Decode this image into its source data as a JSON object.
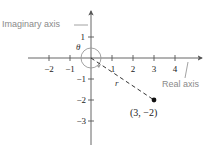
{
  "diagram": {
    "type": "complex-plane",
    "labels": {
      "imaginary_axis": "Imaginary axis",
      "real_axis": "Real axis",
      "theta": "θ",
      "r": "r",
      "point": "(3, −2)"
    },
    "x_ticks": [
      {
        "value": -2,
        "label": "−2"
      },
      {
        "value": -1,
        "label": "−1"
      },
      {
        "value": 1,
        "label": "1"
      },
      {
        "value": 2,
        "label": "2"
      },
      {
        "value": 3,
        "label": "3"
      },
      {
        "value": 4,
        "label": "4"
      }
    ],
    "y_ticks": [
      {
        "value": 1,
        "label": "1"
      },
      {
        "value": -1,
        "label": "−1"
      },
      {
        "value": -2,
        "label": "−2"
      },
      {
        "value": -3,
        "label": "−3"
      }
    ],
    "point": {
      "x": 3,
      "y": -2
    },
    "colors": {
      "axis": "#555555",
      "label_gray": "#8a8a8a",
      "circle": "#999999",
      "point": "#111111"
    }
  }
}
